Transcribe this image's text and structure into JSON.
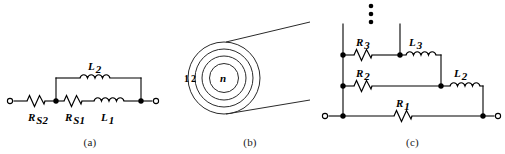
{
  "figure": {
    "background_color": "#ffffff",
    "line_color": "#000000",
    "panels": [
      {
        "id": "a",
        "caption": "(a)",
        "description": "Series-parallel ladder equivalent circuit of a winding",
        "components": [
          {
            "name": "R_S2",
            "symbol": "R",
            "subscript": "S2",
            "type": "resistor"
          },
          {
            "name": "R_S1",
            "symbol": "R",
            "subscript": "S1",
            "type": "resistor"
          },
          {
            "name": "L_2",
            "symbol": "L",
            "subscript": "2",
            "type": "inductor"
          },
          {
            "name": "L_1",
            "symbol": "L",
            "subscript": "1",
            "type": "inductor"
          }
        ],
        "terminals": 2
      },
      {
        "id": "b",
        "caption": "(b)",
        "description": "Cross-section of a multi-turn coil showing concentric turns",
        "turn_labels": [
          "1",
          "2",
          "n"
        ],
        "turn_count_drawn": 4
      },
      {
        "id": "c",
        "caption": "(c)",
        "description": "Ladder network of parallel R-L branches with continuation",
        "components": [
          {
            "name": "R_3",
            "symbol": "R",
            "subscript": "3",
            "type": "resistor"
          },
          {
            "name": "L_3",
            "symbol": "L",
            "subscript": "3",
            "type": "inductor"
          },
          {
            "name": "R_2",
            "symbol": "R",
            "subscript": "2",
            "type": "resistor"
          },
          {
            "name": "L_2",
            "symbol": "L",
            "subscript": "2",
            "type": "inductor"
          },
          {
            "name": "R_1",
            "symbol": "R",
            "subscript": "1",
            "type": "resistor"
          }
        ],
        "continuation_marker": "vertical-ellipsis",
        "terminals": 2
      }
    ]
  },
  "labels": {
    "a": {
      "rs2": "R",
      "rs2_sub": "S2",
      "rs1": "R",
      "rs1_sub": "S1",
      "l2": "L",
      "l2_sub": "2",
      "l1": "L",
      "l1_sub": "1",
      "caption": "(a)"
    },
    "b": {
      "turn1": "1",
      "turn2": "2",
      "turnn": "n",
      "caption": "(b)"
    },
    "c": {
      "r3": "R",
      "r3_sub": "3",
      "l3": "L",
      "l3_sub": "3",
      "r2": "R",
      "r2_sub": "2",
      "l2": "L",
      "l2_sub": "2",
      "r1": "R",
      "r1_sub": "1",
      "caption": "(c)"
    }
  }
}
